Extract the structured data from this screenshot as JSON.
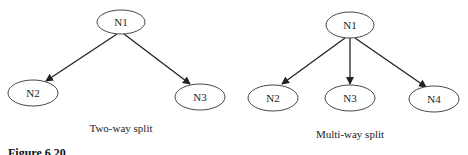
{
  "diagrams": [
    {
      "caption": "Two-way split",
      "root": "N1",
      "children": [
        "N2",
        "N3"
      ]
    },
    {
      "caption": "Multi-way split",
      "root": "N1",
      "children": [
        "N2",
        "N3",
        "N4"
      ]
    }
  ],
  "figure_caption": "Figure 6.20",
  "colors": {
    "stroke": "#222222",
    "background": "#ffffff"
  }
}
